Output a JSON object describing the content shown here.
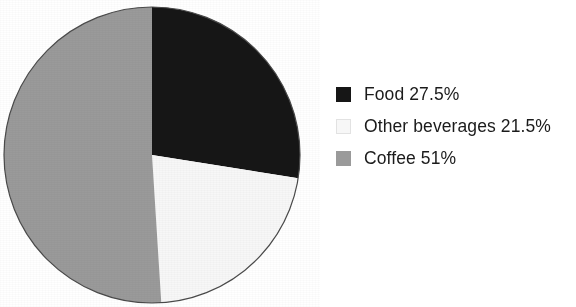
{
  "chart_data": {
    "type": "pie",
    "title": "",
    "subtitle": "",
    "xlabel": "",
    "ylabel": "",
    "grid": false,
    "legend_position": "right",
    "start_angle_deg": 0,
    "direction": "clockwise",
    "total_percent": 100,
    "categories": [
      "Food",
      "Other beverages",
      "Coffee"
    ],
    "values": [
      27.5,
      21.5,
      51
    ],
    "value_unit": "%",
    "slice_colors": [
      "#161616",
      "#f7f7f7",
      "#9a9a9a"
    ],
    "slices": [
      {
        "label": "Food",
        "value": 27.5,
        "value_text": "27.5%",
        "color": "#161616",
        "angle_deg": 99,
        "start_deg": 0,
        "end_deg": 99
      },
      {
        "label": "Other beverages",
        "value": 21.5,
        "value_text": "21.5%",
        "color": "#f7f7f7",
        "angle_deg": 77.4,
        "start_deg": 99,
        "end_deg": 176.4
      },
      {
        "label": "Coffee",
        "value": 51,
        "value_text": "51%",
        "color": "#9a9a9a",
        "angle_deg": 183.6,
        "start_deg": 176.4,
        "end_deg": 360
      }
    ]
  },
  "legend": {
    "items": [
      {
        "swatch_name": "legend-swatch-food",
        "label": "Food 27.5%",
        "color": "#161616"
      },
      {
        "swatch_name": "legend-swatch-other-beverages",
        "label": "Other beverages 21.5%",
        "color": "#f7f7f7"
      },
      {
        "swatch_name": "legend-swatch-coffee",
        "label": "Coffee 51%",
        "color": "#9a9a9a"
      }
    ]
  },
  "pie_geometry": {
    "center_x": 152,
    "center_y": 155,
    "radius": 148,
    "outline_color": "#4a4a4a"
  }
}
